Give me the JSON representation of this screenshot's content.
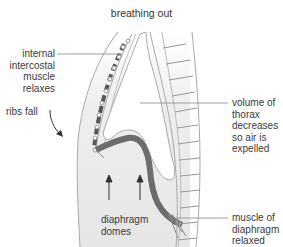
{
  "title": "breathing out",
  "labels": {
    "intercostal": "internal\nintercostal\nmuscle\nrelaxes",
    "ribs": "ribs fall",
    "volume": "volume of\nthorax\ndecreases\nso air is\nexpelled",
    "domes": "diaphragm\ndomes",
    "muscle": "muscle of\ndiaphragm\nrelaxed"
  },
  "colors": {
    "body_fill": "#ececec",
    "wall_fill": "#dcdcdc",
    "outline": "#9a9a9a",
    "muscle": "#777777",
    "arrow": "#333333",
    "leader": "#888888"
  }
}
